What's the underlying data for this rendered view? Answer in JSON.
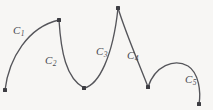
{
  "figure": {
    "background_color": "#f7f6f4",
    "stroke_color": "#55555a",
    "node_color": "#3d3d42",
    "width": 213,
    "height": 110
  },
  "chart_data": {
    "type": "line",
    "title": "",
    "subtitle": "",
    "xlabel": "",
    "ylabel": "",
    "grid": false,
    "legend_position": "inline-labels",
    "xlim": [
      0,
      213
    ],
    "ylim": [
      110,
      0
    ],
    "nodes": [
      {
        "name": "P0",
        "x": 5,
        "y": 90
      },
      {
        "name": "P1",
        "x": 59,
        "y": 20
      },
      {
        "name": "P2",
        "x": 84,
        "y": 88
      },
      {
        "name": "P3",
        "x": 118,
        "y": 8
      },
      {
        "name": "P4",
        "x": 148,
        "y": 87
      },
      {
        "name": "P5",
        "x": 199,
        "y": 104
      }
    ],
    "series": [
      {
        "name": "C1",
        "label": "C",
        "subscript": "1",
        "from": "P0",
        "to": "P1",
        "path": "M 5 90 C 9 58 28 27 59 20",
        "label_x": 13,
        "label_y": 25
      },
      {
        "name": "C2",
        "label": "C",
        "subscript": "2",
        "from": "P1",
        "to": "P2",
        "path": "M 59 20 C 61 52 66 78 84 88",
        "label_x": 45,
        "label_y": 55
      },
      {
        "name": "C3",
        "label": "C",
        "subscript": "3",
        "from": "P2",
        "to": "P3",
        "path": "M 84 88 C 99 85 113 56 118 8",
        "label_x": 96,
        "label_y": 46
      },
      {
        "name": "C4",
        "label": "C",
        "subscript": "4",
        "from": "P3",
        "to": "P4",
        "path": "M 118 8 C 126 34 140 66 148 87",
        "label_x": 127,
        "label_y": 50
      },
      {
        "name": "C5",
        "label": "C",
        "subscript": "5",
        "from": "P4",
        "to": "P5",
        "path": "M 148 87 C 155 66 174 58 188 66 C 199 73 201 92 199 104",
        "label_x": 185,
        "label_y": 74
      }
    ]
  }
}
